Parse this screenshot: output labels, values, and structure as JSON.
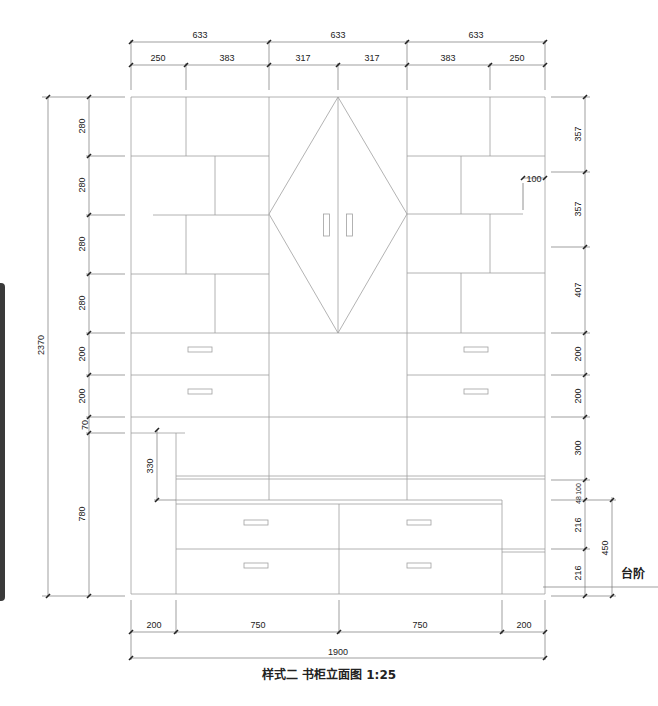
{
  "caption": "样式二 书柜立面图 1:25",
  "step_label": "台阶",
  "dimensions": {
    "top_overall": [
      "633",
      "633",
      "633"
    ],
    "top_detail": [
      "250",
      "383",
      "317",
      "317",
      "383",
      "250"
    ],
    "left_overall": "2370",
    "left_chain": [
      "280",
      "280",
      "280",
      "280",
      "200",
      "200",
      "70",
      "780"
    ],
    "left_inner": "330",
    "right_chain": [
      "357",
      "357",
      "407",
      "200",
      "200",
      "300",
      "48",
      "100",
      "216",
      "216"
    ],
    "right_outer": "450",
    "right_note": "100",
    "bottom_detail": [
      "200",
      "750",
      "750",
      "200"
    ],
    "bottom_overall": "1900"
  },
  "colors": {
    "line": "#9a9a9a",
    "dim_line": "#555555",
    "text": "#222222",
    "side_bar": "#3a3a3a"
  }
}
